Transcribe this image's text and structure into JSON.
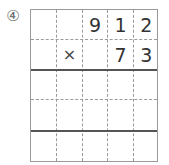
{
  "problem": {
    "label": "④",
    "operator": "×",
    "multiplicand_digits": [
      "",
      "",
      "9",
      "1",
      "2"
    ],
    "multiplier_digits": [
      "",
      "×",
      "",
      "7",
      "3"
    ],
    "grid": {
      "columns": 5,
      "rows": 5,
      "thick_line_after_rows": [
        2,
        4
      ]
    },
    "colors": {
      "grid_line": "#9a9a9a",
      "thick_line": "#555555",
      "digit": "#333333",
      "label": "#6a6a6a"
    }
  }
}
